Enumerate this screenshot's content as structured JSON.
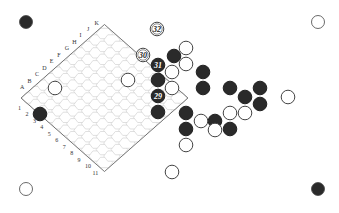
{
  "game": "Hex",
  "board": {
    "size": 11,
    "column_labels": [
      "A",
      "B",
      "C",
      "D",
      "E",
      "F",
      "G",
      "H",
      "I",
      "J",
      "K"
    ],
    "row_labels": [
      "1",
      "2",
      "3",
      "4",
      "5",
      "6",
      "7",
      "8",
      "9",
      "10",
      "11"
    ]
  },
  "colors": {
    "black": "#2a2a2a",
    "white": "#ffffff",
    "grid": "#cfcfcf",
    "edge": "#555555"
  },
  "corner_markers": [
    {
      "position": "top-left",
      "color": "black",
      "x": 26,
      "y": 22
    },
    {
      "position": "top-right",
      "color": "white",
      "x": 318,
      "y": 22
    },
    {
      "position": "bottom-left",
      "color": "white",
      "x": 26,
      "y": 189
    },
    {
      "position": "bottom-right",
      "color": "black",
      "x": 318,
      "y": 189
    }
  ],
  "stones": [
    {
      "color": "black",
      "x": 174,
      "y": 56
    },
    {
      "color": "black",
      "x": 158,
      "y": 65,
      "label": "31"
    },
    {
      "color": "black",
      "x": 158,
      "y": 80
    },
    {
      "color": "black",
      "x": 158,
      "y": 96,
      "label": "29"
    },
    {
      "color": "black",
      "x": 158,
      "y": 112
    },
    {
      "color": "black",
      "x": 203,
      "y": 72
    },
    {
      "color": "black",
      "x": 203,
      "y": 88
    },
    {
      "color": "black",
      "x": 230,
      "y": 88
    },
    {
      "color": "black",
      "x": 245,
      "y": 97
    },
    {
      "color": "black",
      "x": 260,
      "y": 88
    },
    {
      "color": "black",
      "x": 260,
      "y": 104
    },
    {
      "color": "black",
      "x": 186,
      "y": 113
    },
    {
      "color": "black",
      "x": 186,
      "y": 129
    },
    {
      "color": "black",
      "x": 215,
      "y": 121
    },
    {
      "color": "black",
      "x": 230,
      "y": 129
    },
    {
      "color": "black",
      "x": 40,
      "y": 114
    },
    {
      "color": "white",
      "x": 157,
      "y": 29,
      "label": "32"
    },
    {
      "color": "white",
      "x": 143,
      "y": 55,
      "label": "30"
    },
    {
      "color": "white",
      "x": 186,
      "y": 48
    },
    {
      "color": "white",
      "x": 186,
      "y": 64
    },
    {
      "color": "white",
      "x": 172,
      "y": 72
    },
    {
      "color": "white",
      "x": 172,
      "y": 88
    },
    {
      "color": "white",
      "x": 128,
      "y": 80
    },
    {
      "color": "white",
      "x": 55,
      "y": 88
    },
    {
      "color": "white",
      "x": 288,
      "y": 97
    },
    {
      "color": "white",
      "x": 230,
      "y": 113
    },
    {
      "color": "white",
      "x": 245,
      "y": 113
    },
    {
      "color": "white",
      "x": 201,
      "y": 121
    },
    {
      "color": "white",
      "x": 215,
      "y": 130
    },
    {
      "color": "white",
      "x": 186,
      "y": 145
    },
    {
      "color": "white",
      "x": 172,
      "y": 172
    }
  ]
}
